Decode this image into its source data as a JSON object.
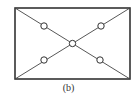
{
  "figure": {
    "caption": "(b)",
    "stroke_color": "#333333",
    "frame": {
      "x": 15,
      "y": 8,
      "width": 115,
      "height": 71
    },
    "diagonals": [
      {
        "x1": 15,
        "y1": 8,
        "x2": 130,
        "y2": 79
      },
      {
        "x1": 130,
        "y1": 8,
        "x2": 15,
        "y2": 79
      }
    ],
    "nodes": [
      {
        "name": "upper-left-node",
        "cx": 44,
        "cy": 26,
        "r": 3.2
      },
      {
        "name": "upper-right-node",
        "cx": 101,
        "cy": 26,
        "r": 3.2
      },
      {
        "name": "center-node",
        "cx": 72.5,
        "cy": 43.5,
        "r": 3.2
      },
      {
        "name": "lower-left-node",
        "cx": 44,
        "cy": 60,
        "r": 3.2
      },
      {
        "name": "lower-right-node",
        "cx": 100,
        "cy": 60,
        "r": 3.2
      }
    ]
  }
}
